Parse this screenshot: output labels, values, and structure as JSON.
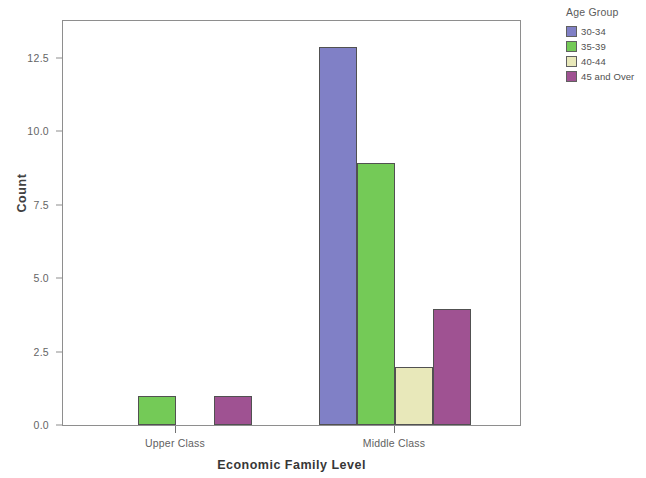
{
  "chart_data": {
    "type": "bar",
    "title": "",
    "xlabel": "Economic Family Level",
    "ylabel": "Count",
    "categories": [
      "Upper Class",
      "Middle Class"
    ],
    "series": [
      {
        "name": "30-34",
        "color": "#7B7BC4",
        "values": [
          0,
          13
        ]
      },
      {
        "name": "35-39",
        "color": "#6FC851",
        "values": [
          1,
          9
        ]
      },
      {
        "name": "40-44",
        "color": "#E8E8B8",
        "values": [
          0,
          2
        ]
      },
      {
        "name": "45 and Over",
        "color": "#9C4B8E",
        "values": [
          1,
          4
        ]
      }
    ],
    "ylim": [
      0,
      13.9
    ],
    "yticks": [
      0.0,
      2.5,
      5.0,
      7.5,
      10.0,
      12.5
    ],
    "ytick_labels": [
      "0.0",
      "2.5",
      "5.0",
      "7.5",
      "10.0",
      "12.5"
    ],
    "grid": false,
    "legend_position": "right",
    "legend_title": "Age Group"
  },
  "axes": {
    "y_title": "Count",
    "x_title": "Economic Family Level",
    "y_tick_labels": [
      "12.5",
      "10.0",
      "7.5",
      "5.0",
      "2.5",
      "0.0"
    ],
    "x_tick_labels": [
      "Upper Class",
      "Middle Class"
    ]
  },
  "legend": {
    "title": "Age Group",
    "items": [
      {
        "label": "30-34",
        "color": "#7B7BC4"
      },
      {
        "label": "35-39",
        "color": "#6FC851"
      },
      {
        "label": "40-44",
        "color": "#E8E8B8"
      },
      {
        "label": "45 and Over",
        "color": "#9C4B8E"
      }
    ]
  }
}
